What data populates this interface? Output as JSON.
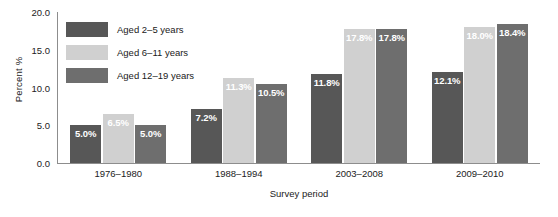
{
  "chart_data": {
    "type": "bar",
    "title": "",
    "xlabel": "Survey period",
    "ylabel": "Percent %",
    "categories": [
      "1976–1980",
      "1988–1994",
      "2003–2008",
      "2009–2010"
    ],
    "series": [
      {
        "name": "Aged 2–5 years",
        "color": "#575757",
        "values": [
          5.0,
          7.2,
          11.8,
          12.1
        ],
        "labels": [
          "5.0%",
          "7.2%",
          "11.8%",
          "12.1%"
        ]
      },
      {
        "name": "Aged 6–11 years",
        "color": "#d0d0d0",
        "values": [
          6.5,
          11.3,
          17.8,
          18.0
        ],
        "labels": [
          "6.5%",
          "11.3%",
          "17.8%",
          "18.0%"
        ]
      },
      {
        "name": "Aged 12–19 years",
        "color": "#6e6e6e",
        "values": [
          5.0,
          10.5,
          17.8,
          18.4
        ],
        "labels": [
          "5.0%",
          "10.5%",
          "17.8%",
          "18.4%"
        ]
      }
    ],
    "ylim": [
      0.0,
      20.0
    ],
    "yticks": [
      "0.0",
      "5.0",
      "10.0",
      "15.0",
      "20.0"
    ],
    "ytick_values": [
      0.0,
      5.0,
      10.0,
      15.0,
      20.0
    ],
    "grid": false,
    "legend_position": "upper-left-inside",
    "data_label_color": "#ffffff"
  },
  "axes": {
    "y_title": "Percent %",
    "x_title": "Survey period"
  },
  "legend": {
    "items": [
      {
        "label": "Aged 2–5 years"
      },
      {
        "label": "Aged 6–11 years"
      },
      {
        "label": "Aged 12–19 years"
      }
    ]
  }
}
